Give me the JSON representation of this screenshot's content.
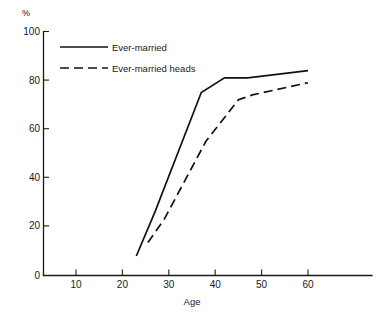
{
  "chart_data": {
    "type": "line",
    "title": "",
    "subtitle": "",
    "xlabel": "Age",
    "ylabel": "%",
    "unit_label": "%",
    "xlim": [
      0,
      70
    ],
    "ylim": [
      0,
      100
    ],
    "grid": false,
    "legend_position": "top-left inside plot",
    "xticks": [
      10,
      20,
      30,
      40,
      50,
      60
    ],
    "xtick_labels": [
      "10",
      "20",
      "30",
      "40",
      "50",
      "60"
    ],
    "yticks": [
      0,
      20,
      40,
      60,
      80,
      100
    ],
    "ytick_labels": [
      "0",
      "20",
      "40",
      "60",
      "80",
      "100"
    ],
    "series": [
      {
        "name": "Ever-married",
        "style": "solid",
        "color": "#111111",
        "x": [
          23,
          27,
          37,
          42,
          47,
          60
        ],
        "values": [
          8,
          26,
          75,
          81,
          81,
          84
        ]
      },
      {
        "name": "Ever-married heads",
        "style": "dashed",
        "color": "#111111",
        "x": [
          25.5,
          29,
          38,
          45,
          48,
          60
        ],
        "values": [
          13.5,
          23,
          55,
          72,
          74,
          79
        ]
      }
    ]
  },
  "legend": {
    "items": [
      {
        "label": "Ever-married",
        "style": "solid"
      },
      {
        "label": "Ever-married heads",
        "style": "dashed"
      }
    ]
  },
  "axes": {
    "y_unit": "%",
    "x_title": "Age"
  }
}
